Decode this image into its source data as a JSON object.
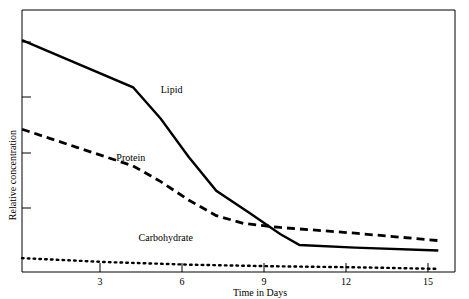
{
  "chart_data": {
    "type": "line",
    "title": "",
    "xlabel": "Time in Days",
    "ylabel": "Relative concentration",
    "xlim": [
      0,
      15.6
    ],
    "ylim": [
      0,
      1.0
    ],
    "xticks": [
      3,
      6,
      9,
      12,
      15
    ],
    "xtick_labels": [
      "3",
      "6",
      "9",
      "12",
      "15"
    ],
    "yticks": [
      0.2,
      0.4,
      0.6,
      0.8,
      1.0
    ],
    "ytick_labels": [
      "",
      "",
      "",
      "",
      ""
    ],
    "grid": false,
    "legend_position": "inline-annotations",
    "series": [
      {
        "name": "Lipid",
        "style": "solid",
        "label_x": 5.0,
        "label_y": 0.685,
        "x": [
          0,
          4,
          5,
          6,
          7,
          8.2,
          9.3,
          10,
          12,
          15
        ],
        "y": [
          0.885,
          0.705,
          0.585,
          0.44,
          0.31,
          0.225,
          0.145,
          0.103,
          0.093,
          0.082
        ]
      },
      {
        "name": "Protein",
        "style": "dashed",
        "label_x": 3.4,
        "label_y": 0.425,
        "x": [
          0,
          2,
          4,
          5,
          6,
          7,
          8,
          9.3,
          12,
          15
        ],
        "y": [
          0.545,
          0.475,
          0.405,
          0.345,
          0.275,
          0.215,
          0.185,
          0.17,
          0.148,
          0.12
        ]
      },
      {
        "name": "Carbohydrate",
        "style": "dotted",
        "label_x": 4.2,
        "label_y": 0.12,
        "x": [
          0,
          3,
          6,
          9,
          12,
          15
        ],
        "y": [
          0.053,
          0.038,
          0.028,
          0.022,
          0.018,
          0.012
        ]
      }
    ]
  },
  "axes": {
    "x_axis_title": "Time in Days",
    "y_axis_title": "Relative concentration",
    "x_tick_labels": [
      "3",
      "6",
      "9",
      "12",
      "15"
    ]
  },
  "labels": {
    "lipid": "Lipid",
    "protein": "Protein",
    "carbohydrate": "Carbohydrate"
  },
  "colors": {
    "line": "#000000",
    "frame": "#000000",
    "background": "#ffffff"
  }
}
